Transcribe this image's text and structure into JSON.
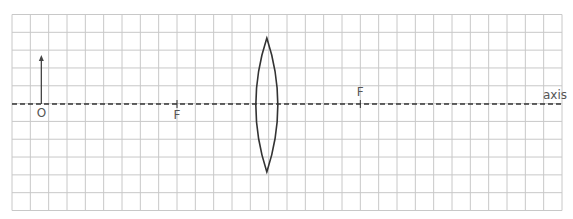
{
  "diagram": {
    "type": "thin convex lens ray diagram grid",
    "grid": {
      "columns": 30,
      "rows": 11
    },
    "axis_label": "axis",
    "object": {
      "label": "O",
      "position_cells_from_left": 1.6,
      "height_cells": 2.75
    },
    "lens": {
      "type": "convex",
      "position_cells_from_left": 13.9
    },
    "focal_points": [
      {
        "label": "F",
        "side": "left",
        "position_cells_from_left": 9.0,
        "label_position": "below"
      },
      {
        "label": "F",
        "side": "right",
        "position_cells_from_left": 19.0,
        "label_position": "above"
      }
    ],
    "colors": {
      "grid": "#c8c8c8",
      "axis": "#333333",
      "lens": "#333333",
      "object": "#444444",
      "text": "#555555"
    }
  }
}
